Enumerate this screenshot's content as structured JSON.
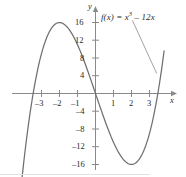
{
  "figure": {
    "name": "cubic-function-graph",
    "curve_color": "#6f6f6f",
    "axis_color": "#8a8a8a",
    "text_color": "#2b2b2b",
    "background": "#ffffff"
  },
  "labels": {
    "function_prefix": "f(x) = x",
    "function_exponent": "3",
    "function_suffix": " – 12x",
    "function_full": "f(x) = x3 – 12x",
    "x_axis_name": "x",
    "y_axis_name": "y"
  },
  "chart_data": {
    "type": "line",
    "title": "",
    "subtitle": "",
    "xlabel": "x",
    "ylabel": "y",
    "legend": [
      "f(x) = x3 – 12x"
    ],
    "legend_position": "inside-top-right",
    "annotation": {
      "text": "f(x) = x3 – 12x",
      "leader_line": true,
      "leader_from": [
        2.05,
        16.5
      ],
      "leader_to": [
        3.4,
        4.5
      ]
    },
    "grid": false,
    "xlim": [
      -4.35,
      3.95
    ],
    "ylim": [
      -22.5,
      18.5
    ],
    "xticks": [
      -3,
      -2,
      -1,
      1,
      2,
      3
    ],
    "xtick_labels": [
      "–3",
      "–2",
      "–1",
      "1",
      "2",
      "3"
    ],
    "yticks": [
      16,
      12,
      8,
      4,
      -4,
      -8,
      -12,
      -16
    ],
    "ytick_labels": [
      "16",
      "12",
      "8",
      "4",
      "–4",
      "–8",
      "–12",
      "–16"
    ],
    "expression": "y = x^3 - 12x",
    "roots": [
      -3.464,
      0,
      3.464
    ],
    "local_maximum": {
      "x": -2,
      "y": 16
    },
    "local_minimum": {
      "x": 2,
      "y": -16
    },
    "inflection_point": {
      "x": 0,
      "y": 0
    },
    "x": [
      -4.3,
      -4.1,
      -3.9,
      -3.7,
      -3.5,
      -3.3,
      -3.1,
      -2.9,
      -2.7,
      -2.5,
      -2.3,
      -2.1,
      -1.9,
      -1.7,
      -1.5,
      -1.3,
      -1.1,
      -0.9,
      -0.7,
      -0.5,
      -0.3,
      -0.1,
      0.1,
      0.3,
      0.5,
      0.7,
      0.9,
      1.1,
      1.3,
      1.5,
      1.7,
      1.9,
      2.1,
      2.3,
      2.5,
      2.7,
      2.9,
      3.1,
      3.3,
      3.5,
      3.7,
      3.8
    ],
    "y": [
      -27.9,
      -19.7,
      -12.5,
      -6.2,
      -0.9,
      3.6,
      7.4,
      10.4,
      12.7,
      14.4,
      15.4,
      15.9,
      15.9,
      15.5,
      14.6,
      13.4,
      11.9,
      10.1,
      8.1,
      5.9,
      3.6,
      1.2,
      -1.2,
      -3.6,
      -5.9,
      -8.1,
      -10.1,
      -11.9,
      -13.4,
      -14.6,
      -15.5,
      -15.9,
      -15.9,
      -15.4,
      -14.4,
      -12.7,
      -10.4,
      -7.4,
      -3.6,
      0.9,
      6.2,
      8.9
    ]
  }
}
